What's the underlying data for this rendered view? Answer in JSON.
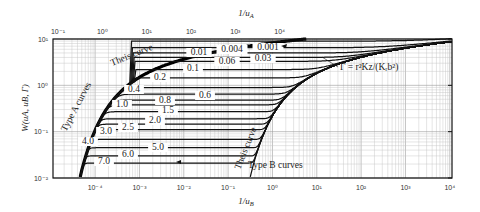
{
  "chart_data": {
    "type": "line",
    "title": "",
    "xlabel_top": "1/u_A",
    "xlabel_bottom": "1/u_B",
    "ylabel": "W(u_A, u_B, Γ)",
    "x_top_ticks": [
      "10⁻¹",
      "10⁰",
      "10¹",
      "10²",
      "10³",
      "10⁴"
    ],
    "x_top_range_log10": [
      -1.1,
      4.9
    ],
    "x_bottom_ticks": [
      "10⁻⁴",
      "10⁻³",
      "10⁻²",
      "10⁻¹",
      "10⁰",
      "10¹",
      "10²",
      "10³",
      "10⁴"
    ],
    "x_bottom_range_log10": [
      -4.95,
      4.05
    ],
    "y_ticks": [
      "10¹",
      "10⁰",
      "10⁻¹",
      "10⁻²"
    ],
    "y_range_log10": [
      -2,
      1
    ],
    "scale": "log-log",
    "grid": true,
    "annotations": {
      "type_a": "Type A curves",
      "type_b": "Type B curves",
      "theis_upper": "Theis curve",
      "theis_lower": "Theis curve",
      "gamma_formula": "Γ = r²Kz/(Kᵣb²)"
    },
    "series": [
      {
        "name": "0.001",
        "W_plateau": 9.0
      },
      {
        "name": "0.004",
        "W_plateau": 6.5
      },
      {
        "name": "0.01",
        "W_plateau": 5.0
      },
      {
        "name": "0.03",
        "W_plateau": 4.0
      },
      {
        "name": "0.06",
        "W_plateau": 3.3
      },
      {
        "name": "0.1",
        "W_plateau": 2.2
      },
      {
        "name": "0.2",
        "W_plateau": 1.45
      },
      {
        "name": "0.4",
        "W_plateau": 0.9
      },
      {
        "name": "0.6",
        "W_plateau": 0.65
      },
      {
        "name": "0.8",
        "W_plateau": 0.48
      },
      {
        "name": "1.0",
        "W_plateau": 0.38
      },
      {
        "name": "1.5",
        "W_plateau": 0.27
      },
      {
        "name": "2.0",
        "W_plateau": 0.19
      },
      {
        "name": "2.5",
        "W_plateau": 0.145
      },
      {
        "name": "3.0",
        "W_plateau": 0.11
      },
      {
        "name": "4.0",
        "W_plateau": 0.068
      },
      {
        "name": "5.0",
        "W_plateau": 0.045
      },
      {
        "name": "6.0",
        "W_plateau": 0.03
      },
      {
        "name": "7.0",
        "W_plateau": 0.021
      }
    ]
  },
  "labels": {
    "x_top_title": "1/u",
    "x_top_sub": "A",
    "x_bottom_title": "1/u",
    "x_bottom_sub": "B",
    "y_title": "W(u",
    "y_title_full": "W(uA, uB, Γ)",
    "type_a": "Type A curves",
    "type_b": "Type B curves",
    "theis_upper": "Theis curve",
    "theis_lower": "Theis curve",
    "gamma_formula": "Γ = r²K",
    "gamma_formula_full": "Γ = r²Kz/(Kᵣb²)"
  }
}
